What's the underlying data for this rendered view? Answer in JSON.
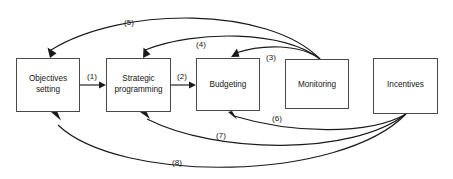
{
  "diagram": {
    "type": "flow-diagram",
    "title": "",
    "background_color": "#ffffff",
    "box_stroke_color": "#4a4a4a",
    "arrow_color": "#1a1a1a",
    "text_color": "#161616",
    "nodes": [
      {
        "id": "objectives",
        "label_line1": "Objectives",
        "label_line2": "setting"
      },
      {
        "id": "strategic",
        "label_line1": "Strategic",
        "label_line2": "programming"
      },
      {
        "id": "budgeting",
        "label_line1": "Budgeting",
        "label_line2": ""
      },
      {
        "id": "monitoring",
        "label_line1": "Monitoring",
        "label_line2": ""
      },
      {
        "id": "incentives",
        "label_line1": "Incentives",
        "label_line2": ""
      }
    ],
    "edges": [
      {
        "id": "e1",
        "label": "(1)",
        "from": "objectives",
        "to": "strategic"
      },
      {
        "id": "e2",
        "label": "(2)",
        "from": "strategic",
        "to": "budgeting"
      },
      {
        "id": "e3",
        "label": "(3)",
        "from": "monitoring",
        "to": "budgeting"
      },
      {
        "id": "e4",
        "label": "(4)",
        "from": "monitoring",
        "to": "strategic"
      },
      {
        "id": "e5",
        "label": "(5)",
        "from": "monitoring",
        "to": "objectives"
      },
      {
        "id": "e6",
        "label": "(6)",
        "from": "incentives",
        "to": "budgeting"
      },
      {
        "id": "e7",
        "label": "(7)",
        "from": "incentives",
        "to": "strategic"
      },
      {
        "id": "e8",
        "label": "(8)",
        "from": "incentives",
        "to": "objectives"
      }
    ]
  }
}
